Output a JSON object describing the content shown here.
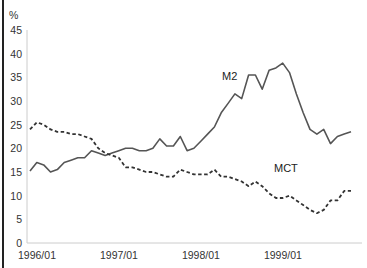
{
  "chart_data": {
    "type": "line",
    "title": "",
    "xlabel": "",
    "ylabel": "%",
    "ylim": [
      0,
      45
    ],
    "yticks": [
      0,
      5,
      10,
      15,
      20,
      25,
      30,
      35,
      40,
      45
    ],
    "xtick_labels": [
      "1996/01",
      "1997/01",
      "1998/01",
      "1999/01"
    ],
    "x_start": "1996/01",
    "x_frequency": "monthly",
    "grid": false,
    "legend": "inline labels",
    "series": [
      {
        "name": "M2",
        "style": "solid",
        "label_pos": [
          222,
          80
        ],
        "values": [
          15.2,
          17,
          16.5,
          15,
          15.5,
          17,
          17.5,
          18,
          18,
          19.5,
          19,
          18.5,
          19,
          19.5,
          20,
          20,
          19.5,
          19.5,
          20,
          22,
          20.5,
          20.5,
          22.5,
          19.5,
          20,
          21.5,
          23,
          24.5,
          27.5,
          29.5,
          31.5,
          30.5,
          35.5,
          35.5,
          32.5,
          36.5,
          37,
          38,
          36,
          31.5,
          27.5,
          24,
          23,
          24,
          21,
          22.5,
          23,
          23.5
        ]
      },
      {
        "name": "MCT",
        "style": "dashed",
        "label_pos": [
          274,
          172
        ],
        "values": [
          24,
          25.5,
          25,
          24,
          23.5,
          23.5,
          23,
          23,
          22.5,
          22,
          20,
          19,
          18.5,
          18,
          16,
          16,
          15.5,
          15,
          15,
          14.5,
          14,
          14,
          15.5,
          15,
          14.5,
          14.5,
          14.5,
          15.5,
          14,
          14,
          13.5,
          13,
          12,
          13,
          12,
          10.5,
          9.5,
          9.5,
          10,
          9,
          8,
          7,
          6.3,
          7,
          9,
          9,
          11,
          11
        ]
      }
    ]
  },
  "colors": {
    "m2_line": "#555555",
    "mct_line": "#333333",
    "axis": "#cccccc"
  }
}
